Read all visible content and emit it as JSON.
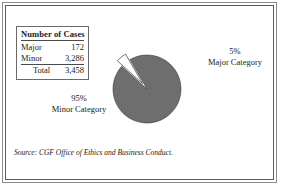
{
  "figure": {
    "source_note": "Source: CGF Office of Ethics and Business Conduct."
  },
  "table": {
    "title": "Number of Cases",
    "rows": [
      {
        "label": "Major",
        "value": "172"
      },
      {
        "label": "Minor",
        "value": "3,286"
      },
      {
        "label": "Total",
        "value": "3,458"
      }
    ]
  },
  "labels": {
    "major": {
      "percent": "5%",
      "name": "Major Category"
    },
    "minor": {
      "percent": "95%",
      "name": "Minor Category"
    }
  },
  "colors": {
    "minor_slice": "#6e6e6e",
    "major_slice": "#ffffff",
    "slice_outline": "#3a3a3a",
    "frame_outer": "#8c8c8c",
    "frame_inner": "#5a5a5a",
    "text": "#1a1a1a"
  },
  "chart_data": {
    "type": "pie",
    "title": "Number of Cases",
    "categories": [
      "Minor Category",
      "Major Category"
    ],
    "values": [
      3286,
      172
    ],
    "percentages": [
      95,
      5
    ],
    "display_percentages": [
      "95%",
      "5%"
    ],
    "total": 3458,
    "exploded": [
      "Major Category"
    ],
    "slice_colors": [
      "#6e6e6e",
      "#ffffff"
    ],
    "legend_position": "top-left",
    "grid": false,
    "xlabel": "",
    "ylabel": "",
    "annotations": [
      "Source: CGF Office of Ethics and Business Conduct."
    ]
  }
}
